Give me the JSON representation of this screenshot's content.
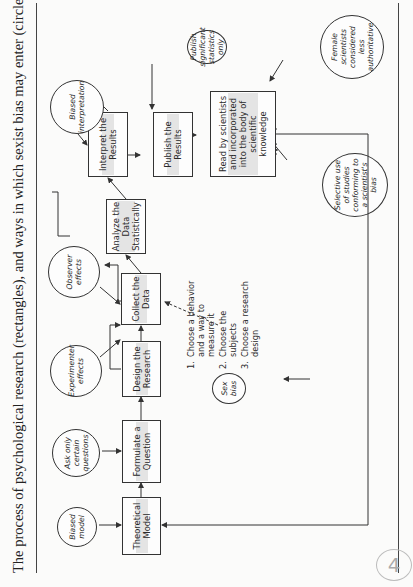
{
  "figure": {
    "title": "The process of psychological research (rectangles), and ways in which sexist bias may enter (circles).",
    "page_stamp": "4"
  },
  "process_steps": {
    "theoretical_model": "Theoretical Model",
    "formulate_question": "Formulate a Question",
    "design_research": "Design the Research",
    "collect_data": "Collect the Data",
    "analyze_data": "Analyze the Data Statistically",
    "interpret_results": "Interpret the Results",
    "publish_results": "Publish the Results",
    "read_incorporated": "Read by scientists and incorporated into the body of scientific knowledge"
  },
  "bias_entries": {
    "biased_model": "Biased model",
    "ask_certain_questions": "Ask only certain questions",
    "experimenter_effects": "Experimenter effects",
    "observer_effects": "Observer effects",
    "biased_interpretation": "Biased interpretation",
    "publish_significant": "Publish significant statistics only",
    "female_scientists": "Female scientists considered less authoritative",
    "selective_use": "Selective use of studies conforming to a scientist's bias",
    "sex_bias": "Sex bias"
  },
  "design_substeps": [
    {
      "num": "1.",
      "text": "Choose a behavior and a way to measure it"
    },
    {
      "num": "2.",
      "text": "Choose the subjects"
    },
    {
      "num": "3.",
      "text": "Choose a research design"
    }
  ],
  "colors": {
    "line": "#333333",
    "text": "#2a2a2a",
    "paper": "#fbfbfa"
  }
}
